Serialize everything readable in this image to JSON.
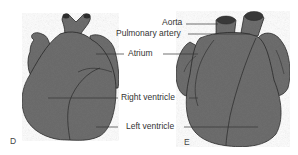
{
  "figure": {
    "panels": [
      {
        "id": "D",
        "label": "D",
        "view": "heart anterior view (left)"
      },
      {
        "id": "E",
        "label": "E",
        "view": "heart anterior view (right)"
      }
    ],
    "labels": {
      "aorta": "Aorta",
      "pulmonary_artery": "Pulmonary artery",
      "atrium": "Atrium",
      "right_ventricle": "Right ventricle",
      "left_ventricle": "Left ventricle"
    },
    "colors": {
      "heart_fill": "#6e6e6e",
      "outline": "#2a2a2a",
      "leader_line": "#333333",
      "background": "#ffffff"
    }
  }
}
